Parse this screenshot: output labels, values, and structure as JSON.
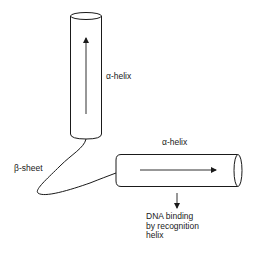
{
  "diagram": {
    "type": "protein structural motif (helix-turn-helix)",
    "colors": {
      "stroke": "#1a1a1a",
      "background": "#ffffff"
    },
    "helix_vertical": {
      "label": "α-helix",
      "arrow_direction": "up"
    },
    "helix_horizontal": {
      "label": "α-helix",
      "arrow_direction": "right"
    },
    "connector": {
      "label": "β-sheet"
    },
    "annotation": {
      "arrow_direction": "down",
      "lines": [
        "DNA binding",
        "by recognition",
        "helix"
      ]
    }
  }
}
